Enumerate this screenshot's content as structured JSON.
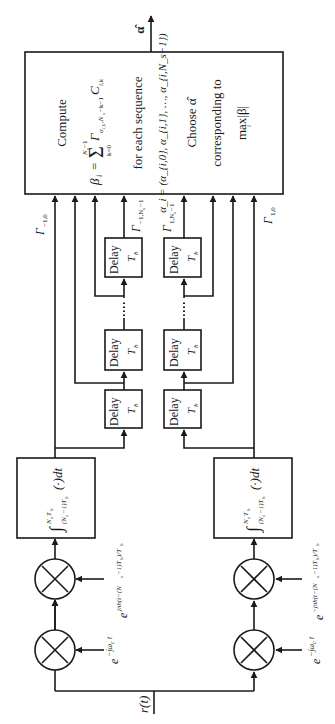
{
  "diagram": {
    "orientation": "rotated 90 degrees counter-clockwise",
    "input_label": "r(t)",
    "output_label": "α̂",
    "main_block": {
      "line1": "Compute",
      "line2": "β_i = Σ_{k=0}^{N_s−1} Γ_{α_{i,k}, N_s−k−1} C_{i,k}",
      "line2_lhs": "β",
      "line2_sub": "i",
      "line2_eq": "=",
      "line2_sum": "Σ",
      "line2_sum_top": "N",
      "line2_sum_top_sub": "s",
      "line2_sum_top_rest": "−1",
      "line2_sum_bottom": "k=0",
      "line2_gamma": "Γ",
      "line2_gamma_sub": "α",
      "line2_gamma_sub_rest": "i,k",
      "line2_gamma_sub_tail": ",N",
      "line2_gamma_sub_tail2": "s",
      "line2_gamma_sub_tail3": "−k−1",
      "line2_c": "C",
      "line2_c_sub": "i,k",
      "line3": "for each sequence",
      "line4": "α_i = (α_{i,0}, α_{i,1}, …, α_{i,N_s−1})",
      "line5": "Choose α̂",
      "line6": "corresponding to",
      "line7": "max|β|",
      "line7_sub": "i"
    },
    "branches": [
      {
        "name": "minus-one",
        "mixer1_label": "e",
        "mixer1_exp": "−jω",
        "mixer1_exp_sub": "c",
        "mixer1_exp_t": "t",
        "mixer2_label": "e",
        "mixer2_exp": "jπh(t−(N",
        "mixer2_exp_sub": "s",
        "mixer2_exp_rest": "−1)T",
        "mixer2_exp_sub2": "b",
        "mixer2_exp_tail": ")/T",
        "mixer2_exp_sub3": "b",
        "integrator_upper": "N",
        "integrator_upper_sub": "s",
        "integrator_upper_rest": "T",
        "integrator_upper_sub2": "b",
        "integrator_lower": "(N",
        "integrator_lower_sub": "s",
        "integrator_lower_rest": "−1)T",
        "integrator_lower_sub2": "b",
        "integrator_body": "(·)dt",
        "gamma_first": "Γ",
        "gamma_first_sub": "−1,0",
        "gamma_last": "Γ",
        "gamma_last_sub": "−1,N",
        "gamma_last_sub2": "s",
        "gamma_last_sub3": "−1"
      },
      {
        "name": "plus-one",
        "mixer1_label": "e",
        "mixer1_exp": "−jω",
        "mixer1_exp_sub": "c",
        "mixer1_exp_t": "t",
        "mixer2_label": "e",
        "mixer2_exp": "−jπh(t−(N",
        "mixer2_exp_sub": "s",
        "mixer2_exp_rest": "−1)T",
        "mixer2_exp_sub2": "b",
        "mixer2_exp_tail": ")/T",
        "mixer2_exp_sub3": "b",
        "integrator_upper": "N",
        "integrator_upper_sub": "s",
        "integrator_upper_rest": "T",
        "integrator_upper_sub2": "b",
        "integrator_lower": "(N",
        "integrator_lower_sub": "s",
        "integrator_lower_rest": "−1)T",
        "integrator_lower_sub2": "b",
        "integrator_body": "(·)dt",
        "gamma_first": "Γ",
        "gamma_first_sub": "1,0",
        "gamma_last": "Γ",
        "gamma_last_sub": "1,N",
        "gamma_last_sub2": "s",
        "gamma_last_sub3": "−1"
      }
    ],
    "delay": {
      "label": "Delay",
      "param": "T",
      "param_sub": "b"
    },
    "ellipsis": "⋯"
  }
}
